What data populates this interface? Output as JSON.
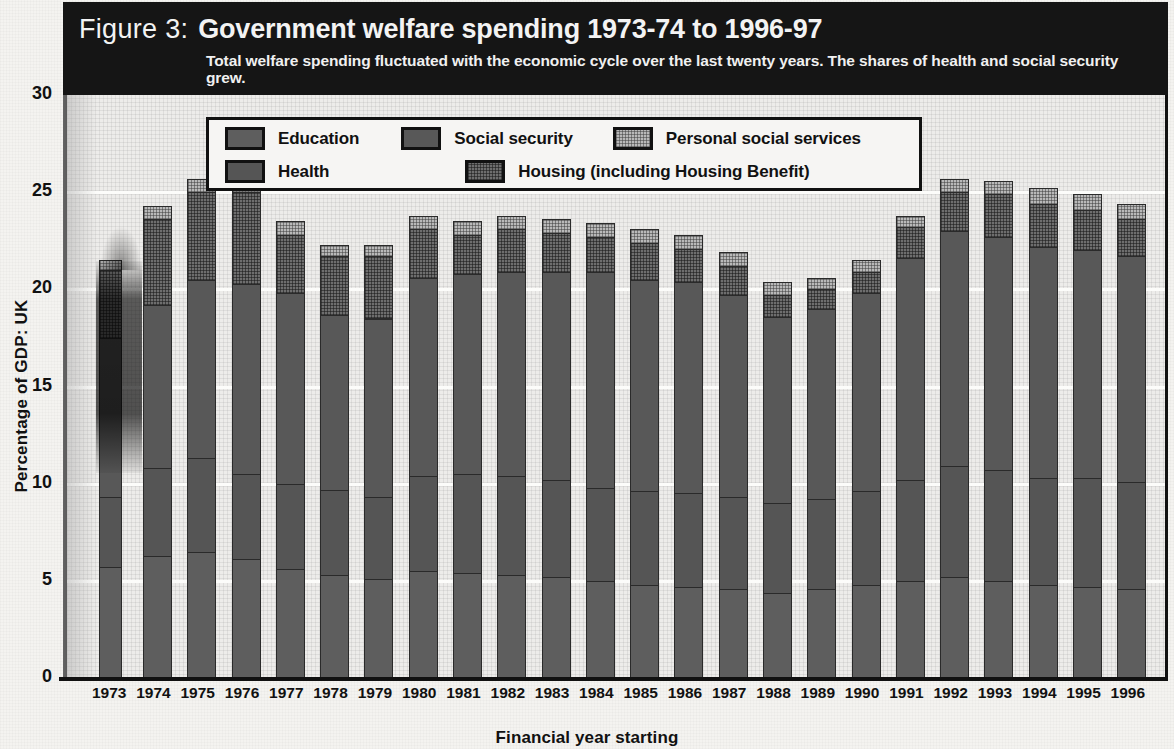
{
  "figure": {
    "label": "Figure 3:",
    "title": "Government welfare spending 1973-74 to 1996-97",
    "subtitle": "Total welfare spending fluctuated with the economic cycle over the last twenty years. The shares of health and social security grew."
  },
  "legend": {
    "items": [
      {
        "key": "education",
        "label": "Education",
        "swatch": "solid-dark-gray",
        "color": "#5e5e5e"
      },
      {
        "key": "social_security",
        "label": "Social security",
        "swatch": "solid-dark-gray",
        "color": "#585858"
      },
      {
        "key": "personal_social_services",
        "label": "Personal social services",
        "swatch": "fine-light-hatch",
        "color": "#b9b9b9"
      },
      {
        "key": "health",
        "label": "Health",
        "swatch": "solid-dark-gray",
        "color": "#555555"
      },
      {
        "key": "housing",
        "label": "Housing (including Housing Benefit)",
        "swatch": "dark-crosshatch",
        "color": "#6e6e6e"
      }
    ]
  },
  "axes": {
    "y_title": "Percentage of GDP: UK",
    "y_ticks": [
      "0",
      "5",
      "10",
      "15",
      "20",
      "25",
      "30"
    ],
    "x_title": "Financial year starting"
  },
  "chart_data": {
    "type": "bar",
    "stacked": true,
    "title": "Government welfare spending 1973-74 to 1996-97",
    "subtitle": "Total welfare spending fluctuated with the economic cycle over the last twenty years. The shares of health and social security grew.",
    "xlabel": "Financial year starting",
    "ylabel": "Percentage of GDP: UK",
    "ylim": [
      0,
      30
    ],
    "yticks": [
      0,
      5,
      10,
      15,
      20,
      25,
      30
    ],
    "grid": true,
    "legend_position": "top-center-inside",
    "categories": [
      "1973",
      "1974",
      "1975",
      "1976",
      "1977",
      "1978",
      "1979",
      "1980",
      "1981",
      "1982",
      "1983",
      "1984",
      "1985",
      "1986",
      "1987",
      "1988",
      "1989",
      "1990",
      "1991",
      "1992",
      "1993",
      "1994",
      "1995",
      "1996"
    ],
    "series": [
      {
        "name": "Education",
        "color": "#5e5e5e",
        "values": [
          5.7,
          6.3,
          6.5,
          6.1,
          5.6,
          5.3,
          5.1,
          5.5,
          5.4,
          5.3,
          5.2,
          5.0,
          4.8,
          4.7,
          4.6,
          4.4,
          4.6,
          4.8,
          5.0,
          5.2,
          5.0,
          4.8,
          4.7,
          4.6
        ]
      },
      {
        "name": "Health",
        "color": "#555555",
        "values": [
          3.6,
          4.5,
          4.8,
          4.4,
          4.4,
          4.4,
          4.2,
          4.9,
          5.1,
          5.1,
          5.0,
          4.8,
          4.8,
          4.8,
          4.7,
          4.6,
          4.6,
          4.8,
          5.2,
          5.7,
          5.7,
          5.5,
          5.6,
          5.5
        ]
      },
      {
        "name": "Social security",
        "color": "#585858",
        "values": [
          8.2,
          8.4,
          9.2,
          9.8,
          9.8,
          9.0,
          9.2,
          10.2,
          10.3,
          10.5,
          10.7,
          11.1,
          10.9,
          10.9,
          10.4,
          9.6,
          9.8,
          10.2,
          11.4,
          12.1,
          12.0,
          11.9,
          11.7,
          11.6
        ]
      },
      {
        "name": "Housing (including Housing Benefit)",
        "color": "#6e6e6e",
        "values": [
          3.5,
          4.4,
          4.5,
          4.7,
          3.0,
          3.0,
          3.2,
          2.5,
          2.0,
          2.2,
          2.0,
          1.8,
          1.9,
          1.7,
          1.5,
          1.1,
          1.0,
          1.1,
          1.6,
          2.0,
          2.2,
          2.2,
          2.1,
          1.9
        ]
      },
      {
        "name": "Personal social services",
        "color": "#b9b9b9",
        "values": [
          0.5,
          0.7,
          0.7,
          0.7,
          0.7,
          0.6,
          0.6,
          0.7,
          0.7,
          0.7,
          0.7,
          0.7,
          0.7,
          0.7,
          0.7,
          0.7,
          0.6,
          0.6,
          0.6,
          0.7,
          0.7,
          0.8,
          0.8,
          0.8
        ]
      }
    ],
    "totals": [
      21.5,
      24.3,
      25.2,
      25.3,
      23.5,
      22.9,
      22.7,
      23.6,
      24.0,
      23.8,
      24.2,
      23.9,
      23.3,
      23.1,
      22.3,
      20.9,
      21.1,
      22.0,
      24.3,
      26.0,
      26.1,
      25.6,
      25.5,
      25.1
    ]
  }
}
